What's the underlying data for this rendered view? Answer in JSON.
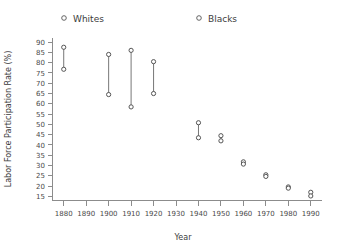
{
  "chart_data": {
    "type": "scatter",
    "title": "",
    "xlabel": "Year",
    "ylabel": "Labor Force Participation Rate (%)",
    "xlim": [
      1875,
      1995
    ],
    "ylim": [
      13,
      92
    ],
    "grid": false,
    "legend_position": "top",
    "x": [
      1880,
      1900,
      1910,
      1920,
      1930,
      1940,
      1950,
      1960,
      1970,
      1980,
      1990
    ],
    "xticks": [
      1880,
      1890,
      1900,
      1910,
      1920,
      1930,
      1940,
      1950,
      1960,
      1970,
      1980,
      1990
    ],
    "xticklabels": [
      "1880",
      "1890",
      "1900",
      "1910",
      "1920",
      "1930",
      "1940",
      "1950",
      "1960",
      "1970",
      "1980",
      "1990"
    ],
    "yticks": [
      15,
      20,
      25,
      30,
      35,
      40,
      45,
      50,
      55,
      60,
      65,
      70,
      75,
      80,
      85,
      90
    ],
    "yticklabels": [
      "15",
      "20",
      "25",
      "30",
      "35",
      "40",
      "45",
      "50",
      "55",
      "60",
      "65",
      "70",
      "75",
      "80",
      "85",
      "90"
    ],
    "series": [
      {
        "name": "Blacks",
        "marker": "open-circle",
        "values": [
          87.5,
          84.0,
          86.0,
          80.5,
          null,
          50.8,
          44.5,
          31.8,
          25.5,
          19.6,
          17.0
        ]
      },
      {
        "name": "Whites",
        "marker": "open-circle",
        "values": [
          76.8,
          64.5,
          58.5,
          65.0,
          null,
          43.5,
          42.0,
          30.7,
          24.7,
          19.0,
          15.2
        ]
      }
    ],
    "pairs": [
      {
        "year": 1880,
        "blacks": 87.5,
        "whites": 76.8
      },
      {
        "year": 1900,
        "blacks": 84.0,
        "whites": 64.5
      },
      {
        "year": 1910,
        "blacks": 86.0,
        "whites": 58.5
      },
      {
        "year": 1920,
        "blacks": 80.5,
        "whites": 65.0
      },
      {
        "year": 1940,
        "blacks": 50.8,
        "whites": 43.5
      },
      {
        "year": 1950,
        "blacks": 44.5,
        "whites": 42.0
      },
      {
        "year": 1960,
        "blacks": 31.8,
        "whites": 30.7
      },
      {
        "year": 1970,
        "blacks": 25.5,
        "whites": 24.7
      },
      {
        "year": 1980,
        "blacks": 19.6,
        "whites": 19.0
      },
      {
        "year": 1990,
        "blacks": 17.0,
        "whites": 15.2
      }
    ]
  },
  "legend": {
    "items": [
      {
        "label": "Whites"
      },
      {
        "label": "Blacks"
      }
    ]
  },
  "colors": {
    "marker_stroke": "#555555",
    "connector": "#777777",
    "axis": "#8c8c8c",
    "text": "#3c3c3c",
    "background": "#ffffff"
  }
}
